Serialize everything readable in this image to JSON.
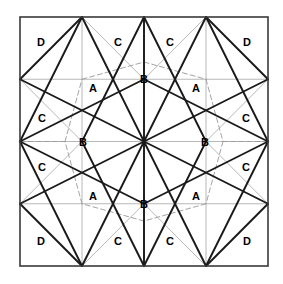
{
  "figure": {
    "type": "geometric-diagram",
    "canvas": {
      "width": 283,
      "height": 284
    },
    "square": {
      "x0": 20,
      "y0": 17,
      "x1": 268,
      "y1": 266,
      "size": 248
    },
    "center": {
      "x": 144,
      "y": 141.5
    },
    "grid_x": [
      20,
      82,
      144,
      206,
      268
    ],
    "grid_y": [
      17,
      79.25,
      141.5,
      203.75,
      266
    ],
    "colors": {
      "border": "#3a3a3a",
      "solid_line": "#1a1a1a",
      "grid_line": "#b0b0b0",
      "dashed_line": "#9a9a9a",
      "label_text": "#000000",
      "background": "#ffffff"
    },
    "stroke_widths": {
      "border": 1.6,
      "solid_line": 1.9,
      "grid_line": 0.9,
      "dashed_line": 0.9
    },
    "dash_pattern": "5,3"
  },
  "labels": [
    {
      "text": "D",
      "x": 41,
      "y": 42,
      "name": "label-d-top-left"
    },
    {
      "text": "C",
      "x": 118,
      "y": 42,
      "name": "label-c-top-left"
    },
    {
      "text": "C",
      "x": 170,
      "y": 42,
      "name": "label-c-top-right"
    },
    {
      "text": "D",
      "x": 247,
      "y": 42,
      "name": "label-d-top-right"
    },
    {
      "text": "B",
      "x": 144,
      "y": 79,
      "name": "label-b-top"
    },
    {
      "text": "A",
      "x": 93,
      "y": 88,
      "name": "label-a-top-left"
    },
    {
      "text": "A",
      "x": 196,
      "y": 88,
      "name": "label-a-top-right"
    },
    {
      "text": "C",
      "x": 42,
      "y": 118,
      "name": "label-c-left-upper"
    },
    {
      "text": "C",
      "x": 246,
      "y": 118,
      "name": "label-c-right-upper"
    },
    {
      "text": "B",
      "x": 83,
      "y": 142,
      "name": "label-b-left"
    },
    {
      "text": "B",
      "x": 205,
      "y": 142,
      "name": "label-b-right"
    },
    {
      "text": "C",
      "x": 42,
      "y": 167,
      "name": "label-c-left-lower"
    },
    {
      "text": "C",
      "x": 246,
      "y": 167,
      "name": "label-c-right-lower"
    },
    {
      "text": "A",
      "x": 93,
      "y": 196,
      "name": "label-a-bottom-left"
    },
    {
      "text": "A",
      "x": 196,
      "y": 196,
      "name": "label-a-bottom-right"
    },
    {
      "text": "B",
      "x": 144,
      "y": 204,
      "name": "label-b-bottom"
    },
    {
      "text": "D",
      "x": 41,
      "y": 241,
      "name": "label-d-bottom-left"
    },
    {
      "text": "C",
      "x": 118,
      "y": 241,
      "name": "label-c-bottom-left"
    },
    {
      "text": "C",
      "x": 170,
      "y": 241,
      "name": "label-c-bottom-right"
    },
    {
      "text": "D",
      "x": 247,
      "y": 241,
      "name": "label-d-bottom-right"
    }
  ],
  "grid_lines": [
    {
      "x1": 82,
      "y1": 17,
      "x2": 82,
      "y2": 266
    },
    {
      "x1": 144,
      "y1": 17,
      "x2": 144,
      "y2": 266
    },
    {
      "x1": 206,
      "y1": 17,
      "x2": 206,
      "y2": 266
    },
    {
      "x1": 20,
      "y1": 79.25,
      "x2": 268,
      "y2": 79.25
    },
    {
      "x1": 20,
      "y1": 141.5,
      "x2": 268,
      "y2": 141.5
    },
    {
      "x1": 20,
      "y1": 203.75,
      "x2": 268,
      "y2": 203.75
    }
  ],
  "solid_lines": [
    {
      "x1": 20,
      "y1": 79.25,
      "x2": 82,
      "y2": 17,
      "name": "edge-tl-diag"
    },
    {
      "x1": 20,
      "y1": 203.75,
      "x2": 82,
      "y2": 266,
      "name": "edge-bl-diag"
    },
    {
      "x1": 206,
      "y1": 17,
      "x2": 268,
      "y2": 79.25,
      "name": "edge-tr-diag"
    },
    {
      "x1": 206,
      "y1": 266,
      "x2": 268,
      "y2": 203.75,
      "name": "edge-br-diag"
    },
    {
      "x1": 82,
      "y1": 17,
      "x2": 144,
      "y2": 141.5,
      "name": "ray-top-left-long"
    },
    {
      "x1": 144,
      "y1": 17,
      "x2": 144,
      "y2": 141.5,
      "name": "ray-top-mid"
    },
    {
      "x1": 206,
      "y1": 17,
      "x2": 144,
      "y2": 141.5,
      "name": "ray-top-right-long"
    },
    {
      "x1": 82,
      "y1": 266,
      "x2": 144,
      "y2": 141.5,
      "name": "ray-bottom-left-long"
    },
    {
      "x1": 144,
      "y1": 266,
      "x2": 144,
      "y2": 141.5,
      "name": "ray-bottom-mid"
    },
    {
      "x1": 206,
      "y1": 266,
      "x2": 144,
      "y2": 141.5,
      "name": "ray-bottom-right-long"
    },
    {
      "x1": 20,
      "y1": 79.25,
      "x2": 144,
      "y2": 141.5,
      "name": "ray-left-upper"
    },
    {
      "x1": 20,
      "y1": 203.75,
      "x2": 144,
      "y2": 141.5,
      "name": "ray-left-lower"
    },
    {
      "x1": 268,
      "y1": 79.25,
      "x2": 144,
      "y2": 141.5,
      "name": "ray-right-upper"
    },
    {
      "x1": 268,
      "y1": 203.75,
      "x2": 144,
      "y2": 141.5,
      "name": "ray-right-lower"
    },
    {
      "x1": 82,
      "y1": 17,
      "x2": 20,
      "y2": 141.5,
      "name": "star-tl-down"
    },
    {
      "x1": 206,
      "y1": 17,
      "x2": 268,
      "y2": 141.5,
      "name": "star-tr-down"
    },
    {
      "x1": 82,
      "y1": 266,
      "x2": 20,
      "y2": 141.5,
      "name": "star-bl-up"
    },
    {
      "x1": 206,
      "y1": 266,
      "x2": 268,
      "y2": 141.5,
      "name": "star-br-up"
    },
    {
      "x1": 20,
      "y1": 141.5,
      "x2": 144,
      "y2": 79.25,
      "name": "star-left-to-topmid"
    },
    {
      "x1": 20,
      "y1": 141.5,
      "x2": 144,
      "y2": 203.75,
      "name": "star-left-to-botmid"
    },
    {
      "x1": 268,
      "y1": 141.5,
      "x2": 144,
      "y2": 79.25,
      "name": "star-right-to-topmid"
    },
    {
      "x1": 268,
      "y1": 141.5,
      "x2": 144,
      "y2": 203.75,
      "name": "star-right-to-botmid"
    },
    {
      "x1": 144,
      "y1": 17,
      "x2": 82,
      "y2": 141.5,
      "name": "star-topmid-to-leftmid"
    },
    {
      "x1": 144,
      "y1": 17,
      "x2": 206,
      "y2": 141.5,
      "name": "star-topmid-to-rightmid"
    },
    {
      "x1": 144,
      "y1": 266,
      "x2": 82,
      "y2": 141.5,
      "name": "star-botmid-to-leftmid"
    },
    {
      "x1": 144,
      "y1": 266,
      "x2": 206,
      "y2": 141.5,
      "name": "star-botmid-to-rightmid"
    }
  ],
  "gray_lines": [
    {
      "x1": 82,
      "y1": 17,
      "x2": 144,
      "y2": 79.25
    },
    {
      "x1": 206,
      "y1": 17,
      "x2": 144,
      "y2": 79.25
    },
    {
      "x1": 82,
      "y1": 266,
      "x2": 144,
      "y2": 203.75
    },
    {
      "x1": 206,
      "y1": 266,
      "x2": 144,
      "y2": 203.75
    },
    {
      "x1": 20,
      "y1": 79.25,
      "x2": 82,
      "y2": 141.5
    },
    {
      "x1": 20,
      "y1": 203.75,
      "x2": 82,
      "y2": 141.5
    },
    {
      "x1": 268,
      "y1": 79.25,
      "x2": 206,
      "y2": 141.5
    },
    {
      "x1": 268,
      "y1": 203.75,
      "x2": 206,
      "y2": 141.5
    },
    {
      "x1": 144,
      "y1": 17,
      "x2": 144,
      "y2": 141.5
    },
    {
      "x1": 144,
      "y1": 266,
      "x2": 144,
      "y2": 141.5
    }
  ],
  "dashed_octagon": [
    {
      "x": 82,
      "y": 79.25
    },
    {
      "x": 144,
      "y": 62
    },
    {
      "x": 206,
      "y": 79.25
    },
    {
      "x": 223,
      "y": 141.5
    },
    {
      "x": 206,
      "y": 203.75
    },
    {
      "x": 144,
      "y": 221
    },
    {
      "x": 82,
      "y": 203.75
    },
    {
      "x": 65,
      "y": 141.5
    }
  ],
  "dashed_spokes": [
    {
      "x1": 144,
      "y1": 62,
      "x2": 144,
      "y2": 17
    },
    {
      "x1": 144,
      "y1": 221,
      "x2": 144,
      "y2": 266
    },
    {
      "x1": 65,
      "y1": 141.5,
      "x2": 20,
      "y2": 141.5
    },
    {
      "x1": 223,
      "y1": 141.5,
      "x2": 268,
      "y2": 141.5
    }
  ]
}
